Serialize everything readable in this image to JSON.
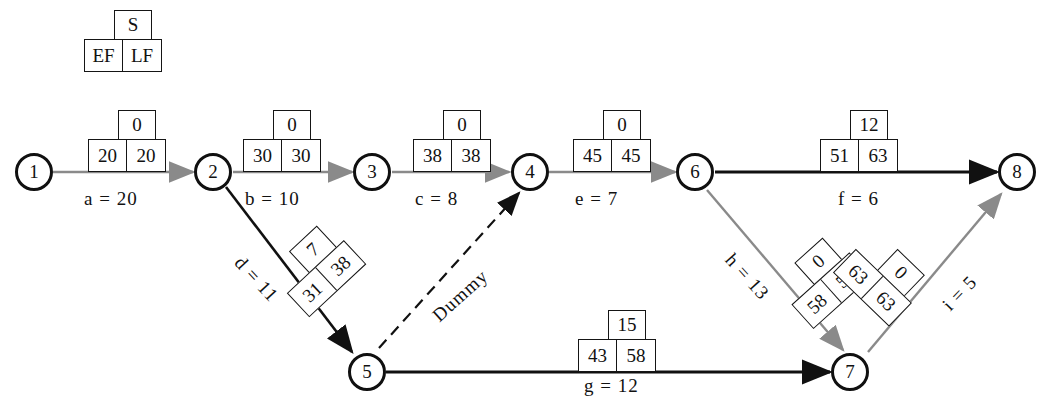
{
  "diagram": {
    "type": "cpm-network",
    "legend": {
      "s": "S",
      "ef": "EF",
      "lf": "LF"
    },
    "nodes": [
      {
        "id": "1",
        "label": "1"
      },
      {
        "id": "2",
        "label": "2"
      },
      {
        "id": "3",
        "label": "3"
      },
      {
        "id": "4",
        "label": "4"
      },
      {
        "id": "5",
        "label": "5"
      },
      {
        "id": "6",
        "label": "6"
      },
      {
        "id": "7",
        "label": "7"
      },
      {
        "id": "8",
        "label": "8"
      }
    ],
    "edges": [
      {
        "id": "a",
        "from": "1",
        "to": "2",
        "label": "a  =  20",
        "duration": 20,
        "style": "solid"
      },
      {
        "id": "b",
        "from": "2",
        "to": "3",
        "label": "b  =  10",
        "duration": 10,
        "style": "solid"
      },
      {
        "id": "c",
        "from": "3",
        "to": "4",
        "label": "c  =  8",
        "duration": 8,
        "style": "solid"
      },
      {
        "id": "d",
        "from": "2",
        "to": "5",
        "label": "d  =  11",
        "duration": 11,
        "style": "solid"
      },
      {
        "id": "e",
        "from": "4",
        "to": "6",
        "label": "e  =  7",
        "duration": 7,
        "style": "solid"
      },
      {
        "id": "f",
        "from": "6",
        "to": "8",
        "label": "f  =  6",
        "duration": 6,
        "style": "solid"
      },
      {
        "id": "g",
        "from": "5",
        "to": "7",
        "label": "g  =  12",
        "duration": 12,
        "style": "solid"
      },
      {
        "id": "h",
        "from": "6",
        "to": "7",
        "label": "h  =  13",
        "duration": 13,
        "style": "solid"
      },
      {
        "id": "i",
        "from": "7",
        "to": "8",
        "label": "i  =  5",
        "duration": 5,
        "style": "solid"
      },
      {
        "id": "dummy",
        "from": "5",
        "to": "4",
        "label": "Dummy",
        "duration": 0,
        "style": "dashed"
      }
    ],
    "boxes": [
      {
        "for": "a",
        "s": "0",
        "ef": "20",
        "lf": "20"
      },
      {
        "for": "b",
        "s": "0",
        "ef": "30",
        "lf": "30"
      },
      {
        "for": "c",
        "s": "0",
        "ef": "38",
        "lf": "38"
      },
      {
        "for": "e",
        "s": "0",
        "ef": "45",
        "lf": "45"
      },
      {
        "for": "f",
        "s": "12",
        "ef": "51",
        "lf": "63"
      },
      {
        "for": "d",
        "s": "7",
        "ef": "31",
        "lf": "38"
      },
      {
        "for": "g",
        "s": "15",
        "ef": "43",
        "lf": "58"
      },
      {
        "for": "h",
        "s": "0",
        "ef": "58",
        "lf": "58"
      },
      {
        "for": "i",
        "s": "0",
        "ef": "63",
        "lf": "63"
      }
    ],
    "colors": {
      "ink": "#111111",
      "critical_edge": "#111111",
      "slack_edge": "#8a8a8a",
      "background": "#ffffff"
    }
  }
}
